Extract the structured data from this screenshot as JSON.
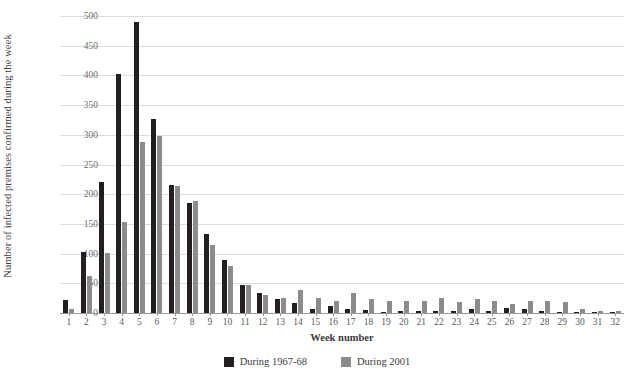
{
  "chart_data": {
    "type": "bar",
    "title": "",
    "xlabel": "Week number",
    "ylabel": "Number of infected premises confirmed during the week",
    "ylim": [
      0,
      500
    ],
    "yticks": [
      0,
      50,
      100,
      150,
      200,
      250,
      300,
      350,
      400,
      450,
      500
    ],
    "grid": true,
    "legend_position": "bottom",
    "categories": [
      "1",
      "2",
      "3",
      "4",
      "5",
      "6",
      "7",
      "8",
      "9",
      "10",
      "11",
      "12",
      "13",
      "14",
      "15",
      "16",
      "17",
      "18",
      "19",
      "20",
      "21",
      "22",
      "23",
      "24",
      "25",
      "26",
      "27",
      "28",
      "29",
      "30",
      "31",
      "32"
    ],
    "series": [
      {
        "name": "During 1967-68",
        "color": "#231f20",
        "values": [
          22,
          102,
          220,
          403,
          490,
          327,
          216,
          186,
          133,
          90,
          48,
          34,
          24,
          17,
          7,
          11,
          6,
          5,
          2,
          3,
          3,
          4,
          3,
          7,
          4,
          9,
          7,
          3,
          2,
          1,
          1,
          1
        ]
      },
      {
        "name": "During 2001",
        "color": "#8c8c8c",
        "values": [
          6,
          62,
          101,
          154,
          288,
          298,
          213,
          188,
          115,
          79,
          48,
          31,
          26,
          39,
          26,
          21,
          33,
          24,
          20,
          21,
          20,
          25,
          19,
          24,
          20,
          15,
          21,
          21,
          18,
          7,
          4,
          3
        ]
      }
    ]
  },
  "legend": {
    "items": [
      {
        "label": "During 1967-68"
      },
      {
        "label": "During 2001"
      }
    ]
  }
}
